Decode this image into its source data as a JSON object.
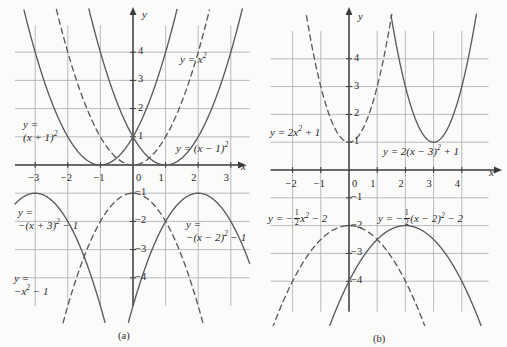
{
  "figure": {
    "caption_a": "(a)",
    "caption_b": "(b)",
    "axis_label_x": "x",
    "axis_label_y": "y"
  },
  "chart_data": [
    {
      "type": "line",
      "panel": "(a)",
      "title": "",
      "xlabel": "x",
      "ylabel": "y",
      "xlim": [
        -3.6,
        3.6
      ],
      "ylim": [
        -4.9,
        4.9
      ],
      "xticks": [
        -3,
        -2,
        -1,
        0,
        1,
        2,
        3
      ],
      "yticks": [
        4,
        3,
        2,
        1,
        -1,
        -2,
        -3,
        -4
      ],
      "xticklabels": [
        "−3",
        "−2",
        "−1",
        "0",
        "1",
        "2",
        "3"
      ],
      "yticklabels": [
        "4",
        "3",
        "2",
        "1",
        "−1",
        "−2",
        "−3",
        "−4"
      ],
      "grid": true,
      "curves": [
        {
          "name": "y = (x + 1)^2",
          "a": 1,
          "h": -1,
          "k": 0,
          "style": "solid",
          "label": "y =\n(x + 1)²",
          "vertex": [
            -1,
            0
          ]
        },
        {
          "name": "y = x^2",
          "a": 1,
          "h": 0,
          "k": 0,
          "style": "dashed",
          "label": "y = x²",
          "vertex": [
            0,
            0
          ]
        },
        {
          "name": "y = (x − 1)^2",
          "a": 1,
          "h": 1,
          "k": 0,
          "style": "solid",
          "label": "y = (x − 1)²",
          "vertex": [
            1,
            0
          ]
        },
        {
          "name": "y = −(x + 3)^2 − 1",
          "a": -1,
          "h": -3,
          "k": -1,
          "style": "solid",
          "label": "y =\n−(x + 3)² − 1",
          "vertex": [
            -3,
            -1
          ]
        },
        {
          "name": "y = −x^2 − 1",
          "a": -1,
          "h": 0,
          "k": -1,
          "style": "dashed",
          "label": "y =\n−x² − 1",
          "vertex": [
            0,
            -1
          ]
        },
        {
          "name": "y = −(x − 2)^2 − 1",
          "a": -1,
          "h": 2,
          "k": -1,
          "style": "solid",
          "label": "y =\n−(x − 2)² − 1",
          "vertex": [
            2,
            -1
          ]
        }
      ]
    },
    {
      "type": "line",
      "panel": "(b)",
      "title": "",
      "xlabel": "x",
      "ylabel": "y",
      "xlim": [
        -2.7,
        4.9
      ],
      "ylim": [
        -4.9,
        4.9
      ],
      "xticks": [
        -2,
        -1,
        0,
        1,
        2,
        3,
        4
      ],
      "yticks": [
        4,
        3,
        2,
        1,
        -1,
        -2,
        -3,
        -4
      ],
      "xticklabels": [
        "−2",
        "−1",
        "0",
        "1",
        "2",
        "3",
        "4"
      ],
      "yticklabels": [
        "4",
        "3",
        "2",
        "1",
        "−1",
        "−2",
        "−3",
        "−4"
      ],
      "grid": true,
      "curves": [
        {
          "name": "y = 2x^2 + 1",
          "a": 2,
          "h": 0,
          "k": 1,
          "style": "dashed",
          "label": "y = 2x² + 1",
          "vertex": [
            0,
            1
          ]
        },
        {
          "name": "y = 2(x − 3)^2 + 1",
          "a": 2,
          "h": 3,
          "k": 1,
          "style": "solid",
          "label": "y = 2(x − 3)² + 1",
          "vertex": [
            3,
            1
          ]
        },
        {
          "name": "y = −½x^2 − 2",
          "a": -0.5,
          "h": 0,
          "k": -2,
          "style": "dashed",
          "label": "y = −½ x² − 2",
          "vertex": [
            0,
            -2
          ]
        },
        {
          "name": "y = −½(x − 2)^2 − 2",
          "a": -0.5,
          "h": 2,
          "k": -2,
          "style": "solid",
          "label": "y = −½ (x − 2)² − 2",
          "vertex": [
            2,
            -2
          ]
        }
      ]
    }
  ],
  "panel_a": {
    "labels": {
      "x_plus_1_sq_line1": "y =",
      "x_plus_1_sq_line2": "(x + 1)",
      "x_sq": "y = x",
      "x_minus_1_sq": "y = (x − 1)",
      "neg_x_plus_3_line1": "y =",
      "neg_x_plus_3_line2a": "−(x + 3)",
      "neg_x_plus_3_line2b": " − 1",
      "neg_x_sq_line1": "y =",
      "neg_x_sq_line2a": "−x",
      "neg_x_sq_line2b": " − 1",
      "neg_x_minus_2_line1": "y =",
      "neg_x_minus_2_line2a": "−(x − 2)",
      "neg_x_minus_2_line2b": " − 1"
    },
    "ticks_x": [
      "−3",
      "−2",
      "−1",
      "0",
      "1",
      "2",
      "3"
    ],
    "ticks_y_pos": [
      "4",
      "3",
      "2",
      "1"
    ],
    "ticks_y_neg": [
      "−1",
      "−2",
      "−3",
      "−4"
    ],
    "axis_x": "x",
    "axis_y": "y",
    "caption": "(a)"
  },
  "panel_b": {
    "labels": {
      "two_x_sq_plus_1a": "y = 2x",
      "two_x_sq_plus_1b": " + 1",
      "two_x_minus_3a": "y = 2(x − 3)",
      "two_x_minus_3b": " + 1",
      "half_x_sq_a": "y = −",
      "half_x_sq_b": "x",
      "half_x_sq_c": " − 2",
      "half_x_minus_2_a": "y = −",
      "half_x_minus_2_b": "(x − 2)",
      "half_x_minus_2_c": " − 2",
      "frac_num": "1",
      "frac_den": "2"
    },
    "ticks_x": [
      "−2",
      "−1",
      "0",
      "1",
      "2",
      "3",
      "4"
    ],
    "ticks_y_pos": [
      "4",
      "3",
      "2",
      "1"
    ],
    "ticks_y_neg": [
      "−1",
      "−2",
      "−3",
      "−4"
    ],
    "axis_x": "x",
    "axis_y": "y",
    "caption": "(b)"
  }
}
